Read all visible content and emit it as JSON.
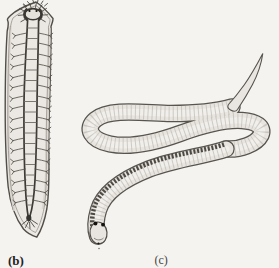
{
  "figure": {
    "type": "biology-textbook-illustration",
    "background_color": "#f4f3f0",
    "palette": {
      "body_fill": "#ebe8e3",
      "outline": "#57544e",
      "nerve_ink": "#3d3a35",
      "label_ink": "#24221f"
    },
    "panels": [
      {
        "id": "b",
        "label": "(b)",
        "illustration": "flatworm-ladder-nervous-system-illustration"
      },
      {
        "id": "c",
        "label": "(c)",
        "illustration": "coiled-ribbon-worm-illustration"
      }
    ]
  }
}
